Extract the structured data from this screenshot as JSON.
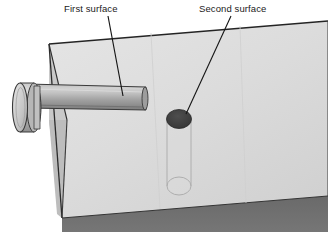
{
  "figure": {
    "background_color": "#ffffff"
  },
  "annotations": [
    {
      "id": "first-surface",
      "label": "First surface",
      "text_x": 64,
      "text_y": 12,
      "leader": {
        "x1": 108,
        "y1": 16,
        "x2": 123,
        "y2": 96
      }
    },
    {
      "id": "second-surface",
      "label": "Second surface",
      "text_x": 199,
      "text_y": 12,
      "leader": {
        "x1": 231,
        "y1": 16,
        "x2": 186,
        "y2": 114
      }
    }
  ],
  "slab": {
    "name": "test-block",
    "top_face_color": "#dedede",
    "top_face_color_shade": "#d2d2d2",
    "side_face_color": "#b4b4b4",
    "front_face_color": "#6e6e6e",
    "edge_color": "#2b2b2b",
    "top_face_points": "49,44 328,21 328,196 62,218",
    "left_side_points": "49,44 62,218 62,218 49,120",
    "side_strip_points": "49,44 49,122 62,218 66,120",
    "front_band_points": "62,218 328,196 328,232 62,232",
    "top_edge": {
      "x1": 49,
      "y1": 44,
      "x2": 328,
      "y2": 21
    },
    "left_edge": {
      "x1": 49,
      "y1": 44,
      "x2": 62,
      "y2": 218
    },
    "bottom_edge": {
      "x1": 62,
      "y1": 218,
      "x2": 328,
      "y2": 196
    }
  },
  "probe": {
    "name": "ultrasonic-probe",
    "head_color_light": "#d6d6d6",
    "head_color_dark": "#9a9a9a",
    "shaft_color_light": "#c6c6c6",
    "shaft_color_dark": "#848484",
    "outline_color": "#3a3a3a",
    "head": {
      "cx": 20,
      "cy": 107,
      "rx": 8,
      "ry": 25
    },
    "head_back_cx": 34,
    "shaft": {
      "x_start": 34,
      "x_end": 146,
      "y_top": 87,
      "y_bottom": 110
    }
  },
  "hole": {
    "name": "entry-hole",
    "fill_color": "#3d3d3d",
    "cx": 179,
    "cy": 119,
    "rx": 12,
    "ry": 9
  },
  "hidden_cylinder": {
    "name": "internal-cylindrical-flaw",
    "outline_color": "#b0b0b0",
    "fill_color": "#dcdcdc",
    "top_cy": 119,
    "bottom_cy": 186,
    "cx": 179,
    "rx": 12,
    "ry": 9
  },
  "icons": {
    "leader_line": "leader-line-icon",
    "probe": "probe-icon",
    "hole": "hole-icon"
  }
}
